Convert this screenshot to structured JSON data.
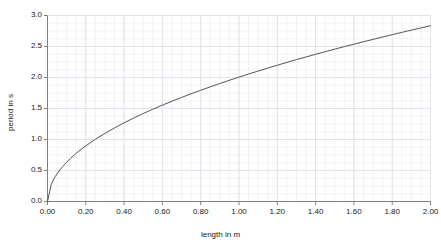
{
  "chart_data": {
    "type": "line",
    "title": "",
    "xlabel": "length in m",
    "ylabel": "period in s",
    "xlim": [
      0.0,
      2.0
    ],
    "ylim": [
      0.0,
      3.0
    ],
    "xticks": [
      "0.00",
      "0.20",
      "0.40",
      "0.60",
      "0.80",
      "1.00",
      "1.20",
      "1.40",
      "1.60",
      "1.80",
      "2.00"
    ],
    "xtick_values": [
      0.0,
      0.2,
      0.4,
      0.6,
      0.8,
      1.0,
      1.2,
      1.4,
      1.6,
      1.8,
      2.0
    ],
    "yticks": [
      "0.0",
      "0.5",
      "1.0",
      "1.5",
      "2.0",
      "2.5",
      "3.0"
    ],
    "ytick_values": [
      0.0,
      0.5,
      1.0,
      1.5,
      2.0,
      2.5,
      3.0
    ],
    "grid": true,
    "grid_minor": true,
    "legend": false,
    "legend_position": "none",
    "series": [
      {
        "name": "period",
        "color": "#555555",
        "x": [
          0.0,
          0.02,
          0.04,
          0.06,
          0.08,
          0.1,
          0.12,
          0.14,
          0.16,
          0.18,
          0.2,
          0.25,
          0.3,
          0.35,
          0.4,
          0.45,
          0.5,
          0.55,
          0.6,
          0.65,
          0.7,
          0.75,
          0.8,
          0.85,
          0.9,
          0.95,
          1.0,
          1.05,
          1.1,
          1.15,
          1.2,
          1.25,
          1.3,
          1.35,
          1.4,
          1.45,
          1.5,
          1.55,
          1.6,
          1.65,
          1.7,
          1.75,
          1.8,
          1.85,
          1.9,
          1.95,
          2.0
        ],
        "y": [
          0.0,
          0.284,
          0.401,
          0.491,
          0.567,
          0.634,
          0.695,
          0.751,
          0.803,
          0.851,
          0.897,
          1.003,
          1.099,
          1.187,
          1.269,
          1.346,
          1.419,
          1.488,
          1.554,
          1.617,
          1.678,
          1.737,
          1.794,
          1.849,
          1.903,
          1.955,
          2.006,
          2.056,
          2.104,
          2.152,
          2.198,
          2.243,
          2.288,
          2.331,
          2.374,
          2.416,
          2.457,
          2.498,
          2.537,
          2.577,
          2.615,
          2.653,
          2.691,
          2.728,
          2.764,
          2.8,
          2.836
        ]
      }
    ],
    "colors": {
      "curve": "#555555",
      "axis": "#808080",
      "grid_major": "#dfe4ea",
      "grid_minor": "#f0f2f5",
      "background": "#ffffff",
      "text": "#202020"
    }
  }
}
